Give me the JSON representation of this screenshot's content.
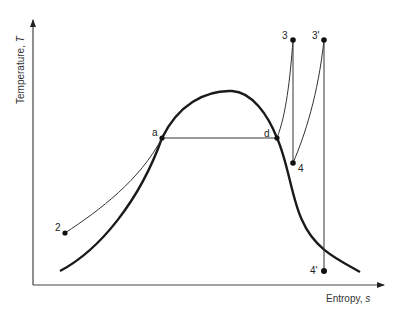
{
  "diagram": {
    "type": "T-s diagram (Rankine cycle with superheat)",
    "axes": {
      "y_label": "Temperature, ",
      "y_symbol": "T",
      "x_label": "Entropy, ",
      "x_symbol": "s"
    },
    "points": [
      {
        "id": "a",
        "label": "a",
        "x": 162,
        "y": 138
      },
      {
        "id": "d",
        "label": "d",
        "x": 277,
        "y": 138
      },
      {
        "id": "3",
        "label": "3",
        "x": 293,
        "y": 40
      },
      {
        "id": "3p",
        "label": "3'",
        "x": 324,
        "y": 40
      },
      {
        "id": "4",
        "label": "4",
        "x": 293,
        "y": 163
      },
      {
        "id": "4p",
        "label": "4'",
        "x": 324,
        "y": 271
      },
      {
        "id": "2",
        "label": "2",
        "x": 65,
        "y": 233
      }
    ],
    "colors": {
      "line": "#1a1a1a",
      "axis": "#444444",
      "background": "#ffffff"
    }
  }
}
